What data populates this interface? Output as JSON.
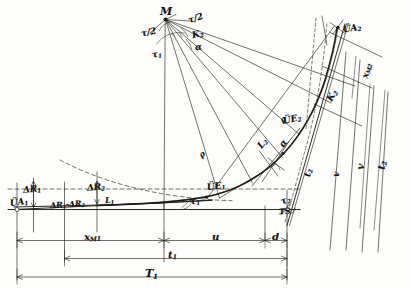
{
  "figure": {
    "kind": "engineering-geometry-diagram",
    "style": "hand-drawn pencil sketch, scanned",
    "ink_color": "#1a1814",
    "paper_color": "#fdfdfb",
    "width": 410,
    "height": 288
  },
  "points": {
    "center": "M",
    "arc_start": "ÜE",
    "arc_start_sub": "1",
    "arc_end": "ÜE",
    "arc_end_sub": "2",
    "tangent_point_1": "ÜA",
    "tangent_point_1_sub": "1",
    "tangent_point_2": "ÜA",
    "tangent_point_2_sub": "2",
    "intersection": "TS"
  },
  "labels": {
    "M": "M",
    "tau_half_left": "τ/2",
    "tau_half_right": "τ/2",
    "tau_1_top": "τ",
    "tau_1_top_sub": "1",
    "K_2": "K",
    "K_2_sub": "2",
    "alpha_top": "α",
    "rho_upper": "ρ",
    "rho_lower": "ρ",
    "UE_1": "ÜE",
    "UE_1_sub": "1",
    "UE_2": "ÜE",
    "UE_2_sub": "2",
    "UA_1": "ÜA",
    "UA_1_sub": "1",
    "UA_2": "ÜA",
    "UA_2_sub": "2",
    "tau_1_curve": "τ",
    "tau_1_curve_sub": "1",
    "tau_2_curve": "τ",
    "tau_2_curve_sub": "2",
    "L_2": "L",
    "L_2_sub": "2",
    "L_1": "L",
    "L_1_sub": "1",
    "alpha_curve": "α",
    "K_2_right": "K",
    "K_2_right_sub": "2",
    "TS": "TS",
    "dR_1": "ΔR",
    "dR_1_sub": "1",
    "dR_2": "ΔR",
    "dR_2_sub": "2",
    "dR_diff": "ΔR",
    "dR_diff_sub1": "1",
    "dR_diff_mid": "-ΔR",
    "dR_diff_sub2": "2",
    "x_M1": "x",
    "x_M1_sub": "M",
    "x_M1_sub2": "1",
    "x_M2": "x",
    "x_M2_sub": "M",
    "x_M2_sub2": "2",
    "u": "u",
    "d": "d",
    "v": "v",
    "t_1": "t",
    "t_1_sub": "1",
    "t_2": "t",
    "t_2_sub": "2",
    "T_1": "T",
    "T_1_sub": "1"
  },
  "dimensions": {
    "bottom": [
      {
        "name": "x_M1",
        "text": "x",
        "sub": "M",
        "sub2": "1"
      },
      {
        "name": "u",
        "text": "u",
        "sub": "",
        "sub2": ""
      },
      {
        "name": "d",
        "text": "d",
        "sub": "",
        "sub2": ""
      },
      {
        "name": "t_1",
        "text": "t",
        "sub": "1",
        "sub2": ""
      },
      {
        "name": "T_1",
        "text": "T",
        "sub": "1",
        "sub2": ""
      }
    ],
    "right": [
      {
        "name": "x_M2",
        "text": "x",
        "sub": "M",
        "sub2": "2"
      },
      {
        "name": "v",
        "text": "v",
        "sub": "",
        "sub2": ""
      },
      {
        "name": "t_2",
        "text": "t",
        "sub": "2",
        "sub2": ""
      }
    ],
    "left": [
      {
        "name": "dR_1",
        "text": "ΔR",
        "sub": "1",
        "sub2": ""
      },
      {
        "name": "dR_2",
        "text": "ΔR",
        "sub": "2",
        "sub2": ""
      },
      {
        "name": "dR_diff",
        "text": "ΔR",
        "sub": "1",
        "sub2": ""
      }
    ]
  },
  "angles": {
    "at_M": [
      "τ/2",
      "τ/2",
      "τ₁",
      "K₂",
      "α"
    ],
    "at_curve": [
      "τ₁",
      "τ₂",
      "L₂",
      "α",
      "K₂"
    ]
  }
}
